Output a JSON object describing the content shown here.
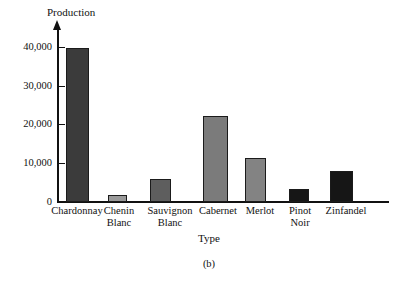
{
  "figure": {
    "caption": "(b)",
    "background_color": "#ffffff",
    "axis_color": "#111111"
  },
  "chart_data": {
    "type": "bar",
    "title": "",
    "xlabel": "Type",
    "ylabel": "Production",
    "categories": [
      "Chardonnay",
      "Chenin\nBlanc",
      "Sauvignon\nBlanc",
      "Cabernet",
      "Merlot",
      "Pinot\nNoir",
      "Zinfandel"
    ],
    "values": [
      40000,
      1700,
      6000,
      22200,
      11500,
      3400,
      8000
    ],
    "bar_colors": [
      "#3b3b3b",
      "#9a9a9a",
      "#5e5e5e",
      "#7b7b7b",
      "#838383",
      "#161616",
      "#161616"
    ],
    "ylim": [
      0,
      43000
    ],
    "ytick_values": [
      0,
      10000,
      20000,
      30000,
      40000
    ],
    "ytick_labels": [
      "0",
      "10,000",
      "20,000",
      "30,000",
      "40,000"
    ],
    "grid": false,
    "legend": null
  }
}
